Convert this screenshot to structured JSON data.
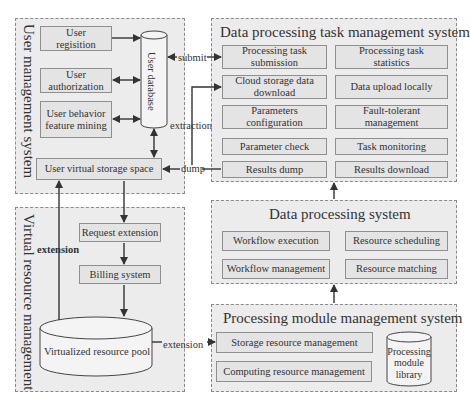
{
  "user_management": {
    "title": "User management system",
    "registration": "User regisition",
    "authorization": "User authorization",
    "behavior": "User behavior feature mining",
    "database": "User database",
    "virtual_storage": "User virtual storage space"
  },
  "virtual_resource": {
    "title": "Virtual resource management",
    "request_extension": "Request extension",
    "billing": "Billing system",
    "pool": "Virtualized resource pool"
  },
  "task_management": {
    "title": "Data processing task management system",
    "items": [
      "Processing task submission",
      "Processing task statistics",
      "Cloud storage data download",
      "Data upload locally",
      "Parameters configuration",
      "Fault-tolerant management",
      "Parameter check",
      "Task monitoring",
      "Results dump",
      "Results download"
    ]
  },
  "data_processing": {
    "title": "Data processing system",
    "items": [
      "Workflow execution",
      "Resource scheduling",
      "Workflow management",
      "Resource matching"
    ]
  },
  "module_management": {
    "title": "Processing module management system",
    "storage": "Storage resource management",
    "computing": "Computing resource management",
    "library": "Processing module library"
  },
  "connectors": {
    "submit": "submit",
    "extraction": "extraction",
    "dump": "dump",
    "extension_left": "extension",
    "extension_right": "extension"
  }
}
